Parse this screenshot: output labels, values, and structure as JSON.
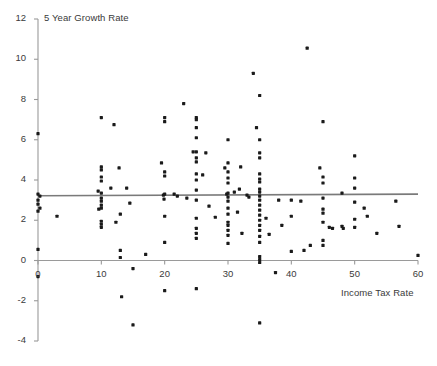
{
  "chart_data": {
    "type": "scatter",
    "title": "",
    "ylabel": "5 Year Growth Rate",
    "xlabel": "Income Tax Rate",
    "xlim": [
      0,
      60
    ],
    "ylim": [
      -4,
      12
    ],
    "xticks": [
      0,
      10,
      20,
      30,
      40,
      50,
      60
    ],
    "yticks": [
      -4,
      -2,
      0,
      2,
      4,
      6,
      8,
      10,
      12
    ],
    "grid": false,
    "legend": null,
    "marker_color": "#1a1a1a",
    "axis_color": "#9a9a9a",
    "trendline": {
      "name": "linear fit",
      "color": "#7a7a7a",
      "x_start": 0,
      "y_start": 3.22,
      "x_end": 60,
      "y_end": 3.3
    },
    "series": [
      {
        "name": "Countries",
        "points": [
          [
            0,
            6.3
          ],
          [
            0,
            3.3
          ],
          [
            0,
            3.0
          ],
          [
            0,
            2.8
          ],
          [
            0,
            2.45
          ],
          [
            0,
            0.55
          ],
          [
            0,
            -0.8
          ],
          [
            0.3,
            3.2
          ],
          [
            0.3,
            2.6
          ],
          [
            3.0,
            2.2
          ],
          [
            9.5,
            3.45
          ],
          [
            9.6,
            2.55
          ],
          [
            10.0,
            7.1
          ],
          [
            10.0,
            4.65
          ],
          [
            10.0,
            4.5
          ],
          [
            10.0,
            4.15
          ],
          [
            10.0,
            3.95
          ],
          [
            10.0,
            3.35
          ],
          [
            10.0,
            3.1
          ],
          [
            10.0,
            2.95
          ],
          [
            10.0,
            2.75
          ],
          [
            10.0,
            2.6
          ],
          [
            10.0,
            1.95
          ],
          [
            10.0,
            1.8
          ],
          [
            10.0,
            1.65
          ],
          [
            11.5,
            3.6
          ],
          [
            12.0,
            6.75
          ],
          [
            12.3,
            1.9
          ],
          [
            12.8,
            4.6
          ],
          [
            13.0,
            2.3
          ],
          [
            13.0,
            0.5
          ],
          [
            13.0,
            0.15
          ],
          [
            13.2,
            -1.8
          ],
          [
            14.0,
            3.6
          ],
          [
            14.5,
            2.85
          ],
          [
            15.0,
            -0.4
          ],
          [
            15.0,
            -3.2
          ],
          [
            17.0,
            0.3
          ],
          [
            19.5,
            4.85
          ],
          [
            19.8,
            3.25
          ],
          [
            19.9,
            3.05
          ],
          [
            20.0,
            6.9
          ],
          [
            20.0,
            7.1
          ],
          [
            20.0,
            4.4
          ],
          [
            20.0,
            4.2
          ],
          [
            20.0,
            3.3
          ],
          [
            20.0,
            2.2
          ],
          [
            20.0,
            0.9
          ],
          [
            20.0,
            -1.5
          ],
          [
            21.5,
            3.3
          ],
          [
            22.0,
            3.2
          ],
          [
            23.0,
            7.8
          ],
          [
            23.5,
            3.1
          ],
          [
            24.5,
            5.4
          ],
          [
            25.0,
            7.1
          ],
          [
            25.0,
            7.0
          ],
          [
            25.0,
            6.6
          ],
          [
            25.0,
            6.1
          ],
          [
            25.0,
            5.4
          ],
          [
            25.0,
            5.1
          ],
          [
            25.0,
            4.9
          ],
          [
            25.0,
            4.3
          ],
          [
            25.0,
            4.0
          ],
          [
            25.0,
            3.5
          ],
          [
            25.0,
            3.0
          ],
          [
            25.0,
            2.1
          ],
          [
            25.0,
            1.6
          ],
          [
            25.0,
            1.35
          ],
          [
            25.0,
            1.1
          ],
          [
            25.0,
            -1.4
          ],
          [
            26.0,
            4.25
          ],
          [
            26.5,
            5.35
          ],
          [
            27.0,
            2.7
          ],
          [
            28.0,
            2.15
          ],
          [
            29.5,
            4.6
          ],
          [
            29.8,
            3.3
          ],
          [
            30.0,
            6.0
          ],
          [
            30.0,
            4.85
          ],
          [
            30.0,
            4.4
          ],
          [
            30.0,
            4.1
          ],
          [
            30.0,
            3.85
          ],
          [
            30.0,
            3.35
          ],
          [
            30.0,
            3.15
          ],
          [
            30.0,
            2.95
          ],
          [
            30.0,
            2.6
          ],
          [
            30.0,
            2.3
          ],
          [
            30.0,
            1.9
          ],
          [
            30.0,
            1.75
          ],
          [
            30.0,
            1.5
          ],
          [
            30.0,
            1.25
          ],
          [
            30.0,
            0.85
          ],
          [
            31.0,
            3.4
          ],
          [
            31.5,
            2.4
          ],
          [
            31.8,
            3.55
          ],
          [
            32.0,
            4.65
          ],
          [
            32.2,
            1.35
          ],
          [
            33.0,
            3.25
          ],
          [
            33.3,
            3.15
          ],
          [
            34.0,
            9.3
          ],
          [
            34.5,
            6.6
          ],
          [
            35.0,
            8.2
          ],
          [
            35.0,
            6.0
          ],
          [
            35.0,
            5.35
          ],
          [
            35.0,
            5.1
          ],
          [
            35.0,
            4.3
          ],
          [
            35.0,
            4.05
          ],
          [
            35.0,
            3.9
          ],
          [
            35.0,
            3.55
          ],
          [
            35.0,
            3.4
          ],
          [
            35.0,
            3.2
          ],
          [
            35.0,
            3.0
          ],
          [
            35.0,
            2.75
          ],
          [
            35.0,
            2.5
          ],
          [
            35.0,
            2.25
          ],
          [
            35.0,
            2.0
          ],
          [
            35.0,
            1.75
          ],
          [
            35.0,
            1.5
          ],
          [
            35.0,
            1.2
          ],
          [
            35.0,
            0.9
          ],
          [
            35.0,
            0.2
          ],
          [
            35.0,
            0.05
          ],
          [
            35.0,
            -0.1
          ],
          [
            35.0,
            -3.1
          ],
          [
            36.0,
            2.1
          ],
          [
            36.5,
            1.3
          ],
          [
            37.5,
            -0.6
          ],
          [
            38.0,
            3.0
          ],
          [
            38.5,
            1.75
          ],
          [
            40.0,
            3.0
          ],
          [
            40.0,
            2.2
          ],
          [
            40.0,
            0.45
          ],
          [
            41.5,
            2.95
          ],
          [
            42.0,
            0.5
          ],
          [
            42.5,
            10.55
          ],
          [
            43.0,
            0.75
          ],
          [
            44.5,
            4.6
          ],
          [
            45.0,
            6.9
          ],
          [
            45.0,
            4.15
          ],
          [
            45.0,
            3.85
          ],
          [
            45.0,
            3.1
          ],
          [
            45.0,
            2.55
          ],
          [
            45.0,
            2.35
          ],
          [
            45.0,
            1.9
          ],
          [
            45.0,
            1.0
          ],
          [
            45.0,
            0.75
          ],
          [
            46.0,
            1.65
          ],
          [
            46.5,
            1.6
          ],
          [
            48.0,
            3.35
          ],
          [
            48.0,
            1.7
          ],
          [
            48.2,
            1.6
          ],
          [
            50.0,
            5.2
          ],
          [
            50.0,
            4.1
          ],
          [
            50.0,
            3.6
          ],
          [
            50.0,
            2.9
          ],
          [
            50.0,
            2.05
          ],
          [
            50.0,
            1.65
          ],
          [
            51.5,
            2.6
          ],
          [
            52.0,
            2.2
          ],
          [
            53.5,
            1.35
          ],
          [
            56.5,
            2.95
          ],
          [
            57.0,
            1.7
          ],
          [
            60.0,
            0.25
          ]
        ]
      }
    ]
  }
}
